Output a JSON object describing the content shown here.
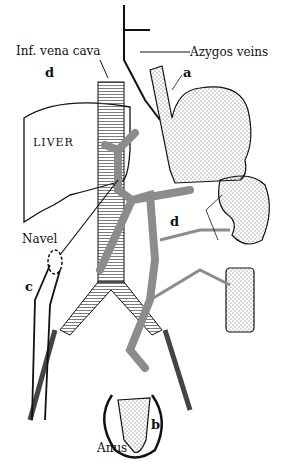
{
  "labels": {
    "inf_vena_cava": "Inf. vena cava",
    "azygos_veins": "Azygos veins",
    "a": "a",
    "b": "b",
    "c": "c",
    "d_top": "d",
    "d_mid": "d",
    "liver": "LIVER",
    "navel": "Navel",
    "anus": "Anus"
  },
  "colors": {
    "ink": "#111111",
    "portal_gray": "#8c8c8c",
    "background": "#ffffff"
  }
}
